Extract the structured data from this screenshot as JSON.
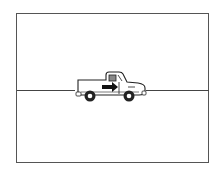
{
  "diagram": {
    "title": "",
    "elements": [
      {
        "type": "frame",
        "name": "panel-frame"
      },
      {
        "type": "line",
        "name": "road-line"
      },
      {
        "type": "icon",
        "name": "pickup-truck-icon",
        "direction": "right"
      }
    ],
    "colors": {
      "stroke": "#222222",
      "frame": "#555555",
      "background": "#ffffff"
    }
  }
}
